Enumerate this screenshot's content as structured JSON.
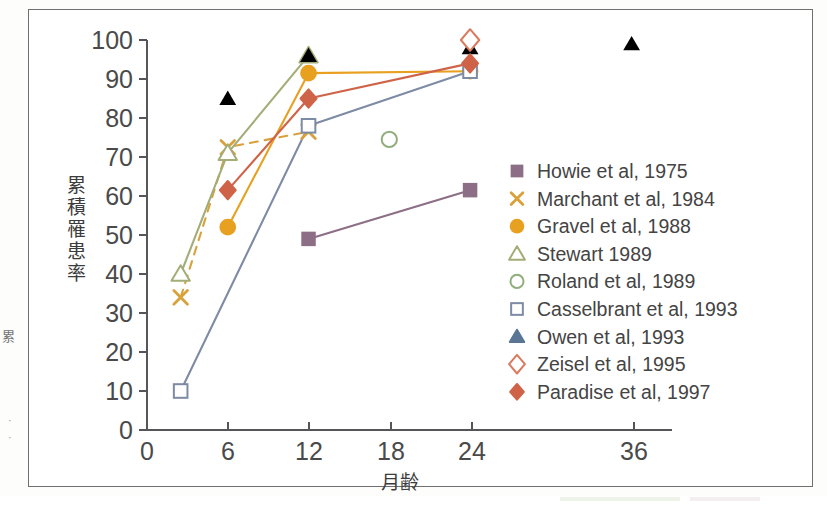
{
  "figure": {
    "frame_color": "#6f6f6f",
    "background": "#ffffff",
    "edge_fragment": "累",
    "edge_marks": "·\n·"
  },
  "chart_data": {
    "type": "line",
    "title": "",
    "subtitle": "",
    "xlabel": "月齢",
    "ylabel": "累積罹患率",
    "xlim": [
      0,
      39
    ],
    "ylim": [
      0,
      100
    ],
    "xticks": [
      0,
      6,
      12,
      18,
      24,
      36
    ],
    "xtick_labels": [
      "0",
      "6",
      "12",
      "18",
      "24",
      "36"
    ],
    "yticks": [
      0,
      10,
      20,
      30,
      40,
      50,
      60,
      70,
      80,
      90,
      100
    ],
    "ytick_labels": [
      "0",
      "10",
      "20",
      "30",
      "40",
      "50",
      "60",
      "70",
      "80",
      "90",
      "100"
    ],
    "grid": false,
    "legend_position": "center-right",
    "series": [
      {
        "name": "Howie et al, 1975",
        "marker": "square-filled",
        "color": "#8c6f86",
        "line": "solid",
        "x": [
          12,
          24
        ],
        "y": [
          49,
          61.5
        ]
      },
      {
        "name": "Marchant et al, 1984",
        "marker": "cross",
        "color": "#d9a13b",
        "line": "dashed",
        "x": [
          2.5,
          6,
          12
        ],
        "y": [
          34,
          72.5,
          76.5
        ]
      },
      {
        "name": "Gravel et al, 1988",
        "marker": "circle-filled",
        "color": "#e8a020",
        "line": "solid",
        "x": [
          6,
          12,
          24
        ],
        "y": [
          52,
          91.5,
          92
        ]
      },
      {
        "name": "Stewart 1989",
        "marker": "triangle-open",
        "color": "#a3ad77",
        "line": "solid",
        "x": [
          2.5,
          6,
          12
        ],
        "y": [
          40,
          71,
          96
        ]
      },
      {
        "name": "Roland et al, 1989",
        "marker": "circle-open",
        "color": "#8fae7c",
        "line": "none",
        "x": [
          18
        ],
        "y": [
          74.5
        ]
      },
      {
        "name": "Casselbrant et al, 1993",
        "marker": "square-open",
        "color": "#7e8ba5",
        "line": "solid",
        "x": [
          2.5,
          12,
          24
        ],
        "y": [
          10,
          78,
          92
        ]
      },
      {
        "name": "Owen et al, 1993",
        "marker": "triangle-filled",
        "color": "#5b7architecture",
        "line": "dashed",
        "x": [
          6,
          12,
          24,
          36
        ],
        "y": [
          85,
          96,
          98,
          99
        ]
      },
      {
        "name": "Zeisel et al, 1995",
        "marker": "diamond-open",
        "color": "#d9795e",
        "line": "none",
        "x": [
          24
        ],
        "y": [
          100
        ]
      },
      {
        "name": "Paradise et al, 1997",
        "marker": "diamond-filled",
        "color": "#cf6348",
        "line": "solid",
        "x": [
          6,
          12,
          24
        ],
        "y": [
          61.5,
          85,
          94
        ]
      }
    ]
  },
  "legend": {
    "entries": [
      {
        "label": "Howie et al, 1975",
        "marker": "square-filled",
        "color": "#8c6f86"
      },
      {
        "label": "Marchant et al, 1984",
        "marker": "cross",
        "color": "#d9a13b"
      },
      {
        "label": "Gravel et al, 1988",
        "marker": "circle-filled",
        "color": "#e8a020"
      },
      {
        "label": "Stewart 1989",
        "marker": "triangle-open",
        "color": "#a3ad77"
      },
      {
        "label": "Roland et al, 1989",
        "marker": "circle-open",
        "color": "#8fae7c"
      },
      {
        "label": "Casselbrant et al, 1993",
        "marker": "square-open",
        "color": "#7e8ba5"
      },
      {
        "label": "Owen et al, 1993",
        "marker": "triangle-filled",
        "color": "#5b7595"
      },
      {
        "label": "Zeisel et al, 1995",
        "marker": "diamond-open",
        "color": "#d9795e"
      },
      {
        "label": "Paradise et al, 1997",
        "marker": "diamond-filled",
        "color": "#cf6348"
      }
    ]
  }
}
